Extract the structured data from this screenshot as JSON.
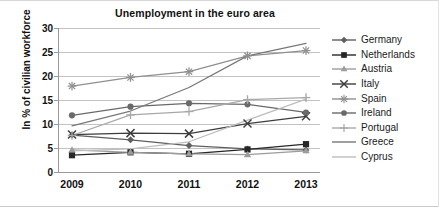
{
  "chart_data": {
    "type": "line",
    "title": "Unemployment in the euro area",
    "xlabel": "",
    "ylabel": "In % of civilian workforce",
    "categories": [
      "2009",
      "2010",
      "2011",
      "2012",
      "2013"
    ],
    "x": [
      2009,
      2010,
      2011,
      2012,
      2013
    ],
    "ylim": [
      0,
      30
    ],
    "yticks": [
      "0",
      "5",
      "10",
      "15",
      "20",
      "25",
      "30"
    ],
    "ytick_values": [
      0,
      5,
      10,
      15,
      20,
      25,
      30
    ],
    "grid": "horizontal",
    "legend_position": "right",
    "series": [
      {
        "name": "Germany",
        "marker": "diamond",
        "color": "#5f5f5f",
        "values": [
          7.7,
          6.7,
          5.5,
          4.8,
          4.6
        ]
      },
      {
        "name": "Netherlands",
        "marker": "square",
        "color": "#272727",
        "values": [
          3.5,
          4.1,
          3.8,
          4.7,
          5.8
        ]
      },
      {
        "name": "Austria",
        "marker": "triangle",
        "color": "#9c9c9c",
        "values": [
          4.6,
          4.1,
          3.8,
          3.6,
          4.4
        ]
      },
      {
        "name": "Italy",
        "marker": "x",
        "color": "#3d3d3d",
        "values": [
          7.8,
          8.1,
          8.0,
          10.1,
          11.6
        ]
      },
      {
        "name": "Spain",
        "marker": "asterisk",
        "color": "#8f8f8f",
        "values": [
          17.9,
          19.7,
          20.9,
          24.2,
          25.3
        ]
      },
      {
        "name": "Ireland",
        "marker": "circle",
        "color": "#6a6a6a",
        "values": [
          11.8,
          13.6,
          14.3,
          14.1,
          12.4
        ]
      },
      {
        "name": "Portugal",
        "marker": "plus",
        "color": "#a8a8a8",
        "values": [
          7.6,
          11.9,
          12.6,
          15.1,
          15.5
        ]
      },
      {
        "name": "Greece",
        "marker": "line",
        "color": "#787878",
        "values": [
          9.6,
          12.7,
          17.6,
          24.2,
          26.8
        ]
      },
      {
        "name": "Cyprus",
        "marker": "line",
        "color": "#bdbdbd",
        "values": [
          4.4,
          4.8,
          6.3,
          10.8,
          15.2
        ]
      }
    ]
  }
}
